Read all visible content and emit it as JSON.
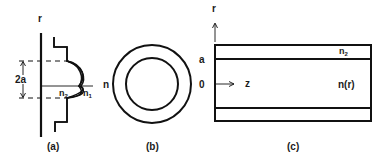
{
  "figure": {
    "panels": [
      {
        "id": "a",
        "caption": "(a)",
        "axis_label": "r",
        "diameter_label": "2a",
        "core_index": "n",
        "core_index_sub": "2",
        "cladding_index": "n",
        "cladding_index_sub": "1"
      },
      {
        "id": "b",
        "caption": "(b)",
        "index_label": "n"
      },
      {
        "id": "c",
        "caption": "(c)",
        "radial_axis_label": "r",
        "axial_axis_label": "z",
        "radius_label": "a",
        "origin_label": "0",
        "cladding_index": "n",
        "cladding_index_sub": "2",
        "core_index": "n(r)"
      }
    ]
  },
  "colors": {
    "ink": "#111111",
    "background": "#ffffff"
  }
}
